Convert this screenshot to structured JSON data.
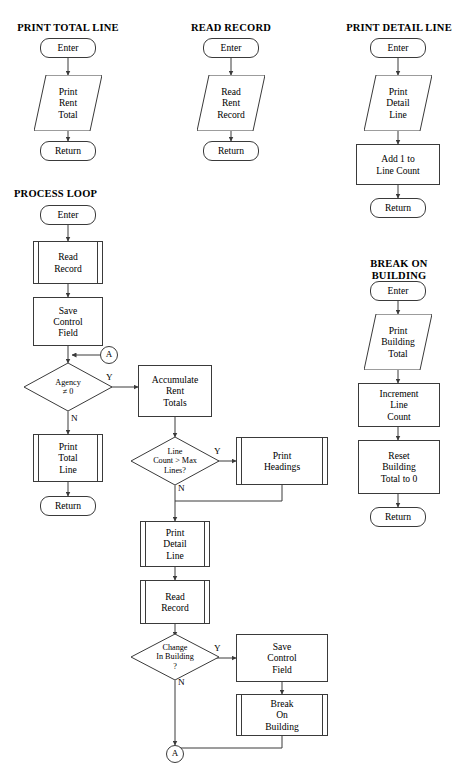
{
  "document": {
    "kind": "flowchart",
    "background_color": "#ffffff",
    "line_color": "#3a3a3a",
    "text_color": "#000000"
  },
  "sections": [
    {
      "id": "print-total-line",
      "title": "PRINT TOTAL LINE"
    },
    {
      "id": "read-record",
      "title": "READ RECORD"
    },
    {
      "id": "print-detail-line",
      "title": "PRINT DETAIL LINE"
    },
    {
      "id": "process-loop",
      "title": "PROCESS LOOP"
    },
    {
      "id": "break-on-building",
      "title": "BREAK ON\nBUILDING"
    }
  ],
  "nodes": {
    "ptl_enter": {
      "label": "Enter",
      "shape": "terminator"
    },
    "ptl_print": {
      "label": "Print\nRent\nTotal",
      "shape": "io"
    },
    "ptl_return": {
      "label": "Return",
      "shape": "terminator"
    },
    "rr_enter": {
      "label": "Enter",
      "shape": "terminator"
    },
    "rr_read": {
      "label": "Read\nRent\nRecord",
      "shape": "io"
    },
    "rr_return": {
      "label": "Return",
      "shape": "terminator"
    },
    "pdl_enter": {
      "label": "Enter",
      "shape": "terminator"
    },
    "pdl_print": {
      "label": "Print\nDetail\nLine",
      "shape": "io"
    },
    "pdl_add": {
      "label": "Add 1 to\nLine Count",
      "shape": "process"
    },
    "pdl_return": {
      "label": "Return",
      "shape": "terminator"
    },
    "bob_enter": {
      "label": "Enter",
      "shape": "terminator"
    },
    "bob_print": {
      "label": "Print\nBuilding\nTotal",
      "shape": "io"
    },
    "bob_incr": {
      "label": "Increment\nLine\nCount",
      "shape": "process"
    },
    "bob_reset": {
      "label": "Reset\nBuilding\nTotal to 0",
      "shape": "process"
    },
    "bob_return": {
      "label": "Return",
      "shape": "terminator"
    },
    "pl_enter": {
      "label": "Enter",
      "shape": "terminator"
    },
    "pl_read1": {
      "label": "Read\nRecord",
      "shape": "predefined"
    },
    "pl_save1": {
      "label": "Save\nControl\nField",
      "shape": "process"
    },
    "pl_connA_in": {
      "label": "A",
      "shape": "connector"
    },
    "pl_agency": {
      "label": "Agency\n≠ 0",
      "shape": "decision"
    },
    "pl_accum": {
      "label": "Accumulate\nRent\nTotals",
      "shape": "process"
    },
    "pl_printtot": {
      "label": "Print\nTotal\nLine",
      "shape": "predefined"
    },
    "pl_return": {
      "label": "Return",
      "shape": "terminator"
    },
    "pl_linecnt": {
      "label": "Line\nCount > Max\nLines?",
      "shape": "decision"
    },
    "pl_headings": {
      "label": "Print\nHeadings",
      "shape": "predefined"
    },
    "pl_printdet": {
      "label": "Print\nDetail\nLine",
      "shape": "predefined"
    },
    "pl_read2": {
      "label": "Read\nRecord",
      "shape": "predefined"
    },
    "pl_change": {
      "label": "Change\nIn Building\n?",
      "shape": "decision"
    },
    "pl_save2": {
      "label": "Save\nControl\nField",
      "shape": "process"
    },
    "pl_break": {
      "label": "Break\nOn\nBuilding",
      "shape": "predefined"
    },
    "pl_connA_out": {
      "label": "A",
      "shape": "connector"
    }
  },
  "branch_labels": {
    "agency_yes": "Y",
    "agency_no": "N",
    "linecnt_yes": "Y",
    "linecnt_no": "N",
    "change_yes": "Y",
    "change_no": "N"
  }
}
